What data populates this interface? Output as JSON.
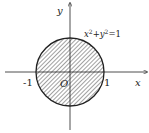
{
  "diagram": {
    "axes": {
      "x_label": "x",
      "y_label": "y",
      "origin_label": "O"
    },
    "ticks": {
      "neg_one": "-1",
      "pos_one": "1"
    },
    "curve": {
      "equation_base_x": "x",
      "equation_sup_x": "2",
      "equation_plus": "+y",
      "equation_sup_y": "2",
      "equation_rhs": "=1",
      "equation_full": "x²+y²=1",
      "radius": 1,
      "center": [
        0,
        0
      ],
      "fill": "hatched"
    },
    "colors": {
      "stroke": "#222222",
      "hatch": "#444444",
      "background": "#ffffff"
    }
  }
}
